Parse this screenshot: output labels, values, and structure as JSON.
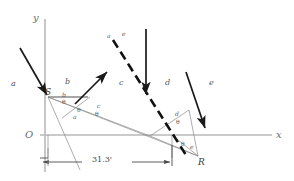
{
  "figure": {
    "name": "ray-diagram-reflection-refraction",
    "axes": {
      "y_label": "y",
      "x_label": "x",
      "origin_label": "O",
      "axis_color": "#b9b9b9"
    },
    "regions": [
      {
        "label": "a",
        "x": 11,
        "y": 80
      },
      {
        "label": "b",
        "x": 65,
        "y": 78
      },
      {
        "label": "c",
        "x": 119,
        "y": 79
      },
      {
        "label": "d",
        "x": 165,
        "y": 79
      },
      {
        "label": "e",
        "x": 209,
        "y": 79
      }
    ],
    "points": [
      {
        "label": "S",
        "x": 45,
        "y": 91
      },
      {
        "label": "R",
        "x": 198,
        "y": 161
      }
    ],
    "top_dashed_labels": [
      {
        "label": "a",
        "x": 107,
        "y": 34
      },
      {
        "label": "e",
        "x": 122,
        "y": 32
      }
    ],
    "angle_labels": [
      {
        "label": "b",
        "x": 62,
        "y": 95,
        "kind": "ray"
      },
      {
        "label": "θ",
        "x": 62,
        "y": 102,
        "kind": "theta"
      },
      {
        "label": "θ",
        "x": 78,
        "y": 110,
        "kind": "theta"
      },
      {
        "label": "a",
        "x": 74,
        "y": 118,
        "kind": "ray"
      },
      {
        "label": "c",
        "x": 97,
        "y": 107,
        "kind": "ray"
      },
      {
        "label": "θ",
        "x": 95,
        "y": 114,
        "kind": "theta"
      },
      {
        "label": "d",
        "x": 175,
        "y": 115,
        "kind": "ray"
      },
      {
        "label": "θ",
        "x": 176,
        "y": 123,
        "kind": "theta"
      },
      {
        "label": "θ",
        "x": 181,
        "y": 145,
        "kind": "theta"
      },
      {
        "label": "e",
        "x": 190,
        "y": 148,
        "kind": "ray"
      }
    ],
    "dimension": {
      "value": "31.3'",
      "label_x": 92,
      "label_y": 158
    },
    "colors": {
      "ray_thick": "#1a1a1a",
      "ray_thin": "#8a8a8a",
      "axis": "#b9b9b9",
      "dashed": "#111111",
      "text": "#4a4a4a"
    }
  }
}
